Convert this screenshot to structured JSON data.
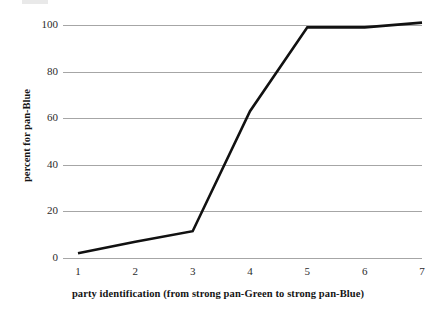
{
  "chart_data": {
    "type": "line",
    "title": "",
    "subtitle": "",
    "xlabel": "party identification (from strong pan-Green to strong pan-Blue)",
    "ylabel": "percent for pan-Blue",
    "x": [
      1,
      2,
      3,
      4,
      5,
      6,
      7
    ],
    "categories": [
      "1",
      "2",
      "3",
      "4",
      "5",
      "6",
      "7"
    ],
    "values": [
      2,
      7,
      11.5,
      63,
      99,
      99,
      101
    ],
    "series": [
      {
        "name": "percent for pan-Blue",
        "values": [
          2,
          7,
          11.5,
          63,
          99,
          99,
          101
        ]
      }
    ],
    "xlim": [
      1,
      7
    ],
    "ylim": [
      0,
      100
    ],
    "y_ticks": [
      0,
      20,
      40,
      60,
      80,
      100
    ],
    "y_tick_labels": [
      "0",
      "20",
      "40",
      "60",
      "80",
      "100"
    ],
    "x_ticks": [
      1,
      2,
      3,
      4,
      5,
      6,
      7
    ],
    "x_tick_labels": [
      "1",
      "2",
      "3",
      "4",
      "5",
      "6",
      "7"
    ],
    "grid": "horizontal",
    "legend": "none",
    "line_color": "#111111",
    "grid_color": "#a6a6a6",
    "background_color": "#ffffff"
  },
  "axes": {
    "y_title": "percent for pan-Blue",
    "x_title": "party identification (from strong pan-Green to strong pan-Blue)"
  }
}
